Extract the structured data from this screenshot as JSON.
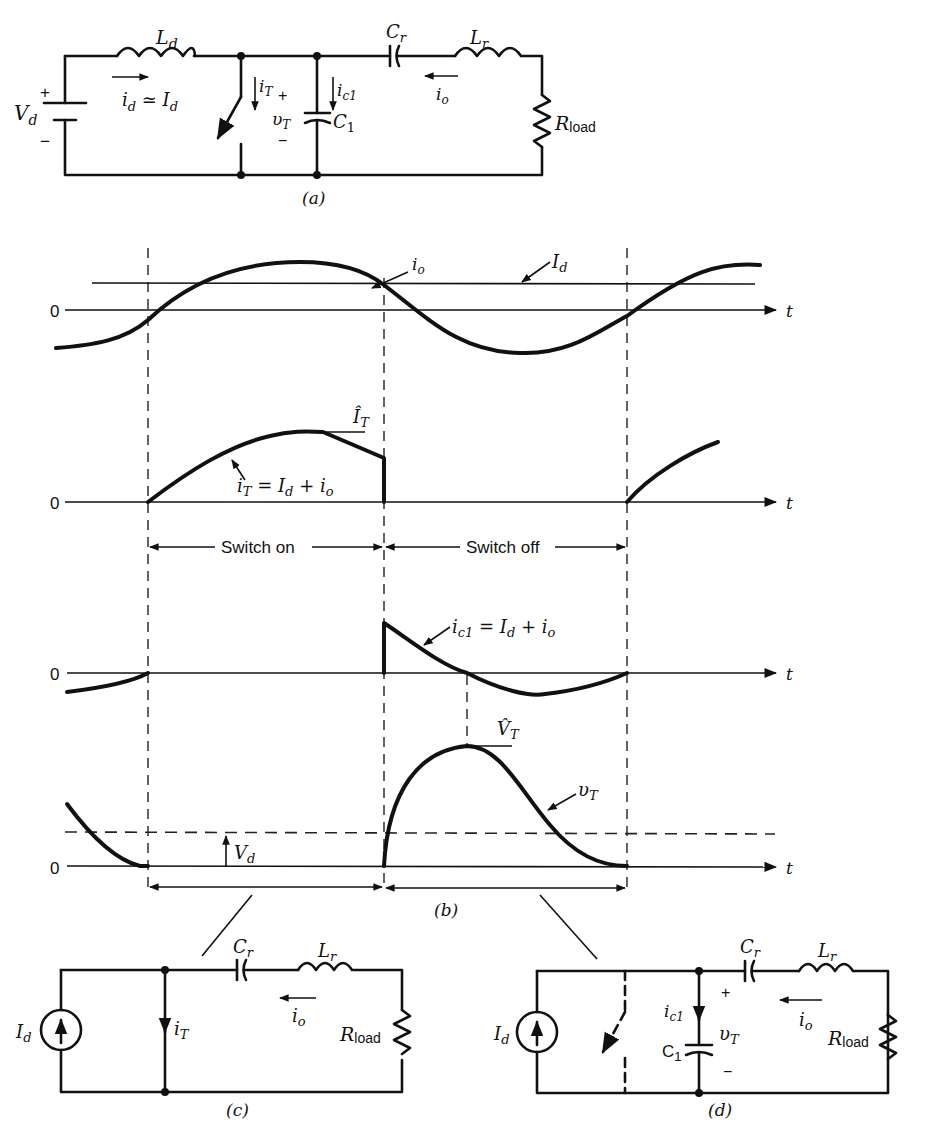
{
  "figure": {
    "caption_a": "(a)",
    "caption_b": "(b)",
    "caption_c": "(c)",
    "caption_d": "(d)"
  },
  "circuit_a": {
    "source_label": "V",
    "source_sub": "d",
    "plus": "+",
    "minus": "−",
    "Ld_label": "L",
    "Ld_sub": "d",
    "id_label": "i",
    "id_sub": "d",
    "id_rel": " ≃ I",
    "id_rel_sub": "d",
    "iT_label": "i",
    "iT_sub": "T",
    "vT_label": "υ",
    "vT_sub": "T",
    "ic1_label": "i",
    "ic1_sub": "c1",
    "C1_label": "C",
    "C1_sub": "1",
    "Cr_label": "C",
    "Cr_sub": "r",
    "Lr_label": "L",
    "Lr_sub": "r",
    "io_label": "i",
    "io_sub": "o",
    "R_label": "R",
    "R_sub": "load"
  },
  "waveforms": {
    "time_axis_label": "t",
    "zero_label": "0",
    "io_label": "i",
    "io_sub": "o",
    "Id_label": "I",
    "Id_sub": "d",
    "iT_peak_label": "Î",
    "iT_peak_sub": "T",
    "iT_eq": "i",
    "iT_eq_sub": "T",
    "iT_eq_rhs": " = I",
    "iT_eq_rhs_sub": "d",
    "iT_eq_tail": " + i",
    "iT_eq_tail_sub": "o",
    "switch_on": "Switch on",
    "switch_off": "Switch off",
    "ic1_eq": "i",
    "ic1_eq_sub": "c1",
    "ic1_eq_rhs": " = I",
    "ic1_eq_rhs_sub": "d",
    "ic1_eq_tail": " + i",
    "ic1_eq_tail_sub": "o",
    "vT_peak_label": "V̂",
    "vT_peak_sub": "T",
    "vT_label": "υ",
    "vT_sub": "T",
    "Vd_label": "V",
    "Vd_sub": "d"
  },
  "circuit_c": {
    "Id_label": "I",
    "Id_sub": "d",
    "iT_label": "i",
    "iT_sub": "T",
    "Cr_label": "C",
    "Cr_sub": "r",
    "Lr_label": "L",
    "Lr_sub": "r",
    "io_label": "i",
    "io_sub": "o",
    "R_label": "R",
    "R_sub": "load"
  },
  "circuit_d": {
    "Id_label": "I",
    "Id_sub": "d",
    "ic1_label": "i",
    "ic1_sub": "c1",
    "C1_label": "C",
    "C1_sub": "1",
    "vT_label": "υ",
    "vT_sub": "T",
    "plus": "+",
    "minus": "−",
    "Cr_label": "C",
    "Cr_sub": "r",
    "Lr_label": "L",
    "Lr_sub": "r",
    "io_label": "i",
    "io_sub": "o",
    "R_label": "R",
    "R_sub": "load"
  }
}
